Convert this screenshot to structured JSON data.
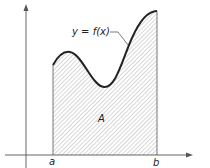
{
  "figure": {
    "curve_label": "y = f(x)",
    "area_label": "A",
    "x_labels": {
      "left": "a",
      "right": "b"
    },
    "colors": {
      "line": "#222222",
      "hatch": "#9a9a9a",
      "axis": "#555555"
    }
  }
}
